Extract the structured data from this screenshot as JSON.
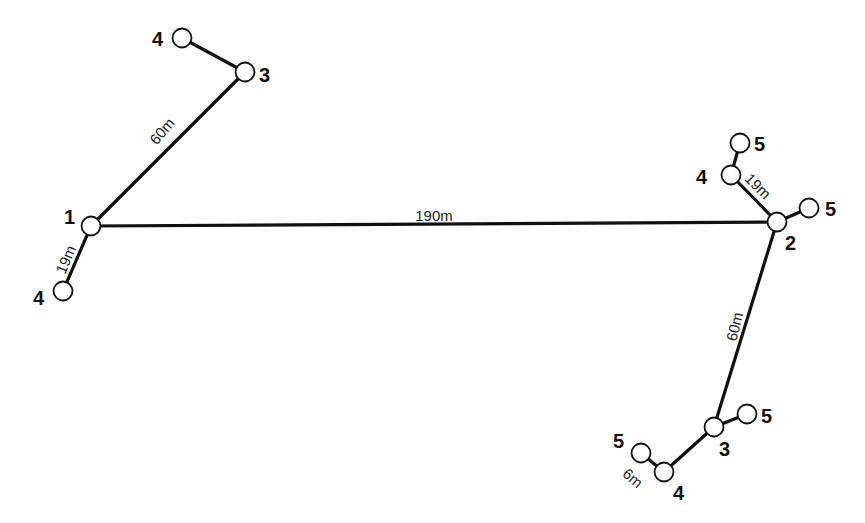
{
  "diagram": {
    "type": "tree-network",
    "nodes": [
      {
        "id": "n1",
        "label": "1",
        "x": 91,
        "y": 226,
        "lx": 64,
        "ly": 224
      },
      {
        "id": "n4a",
        "label": "4",
        "x": 63,
        "y": 291,
        "lx": 33,
        "ly": 305
      },
      {
        "id": "n3a",
        "label": "3",
        "x": 245,
        "y": 72,
        "lx": 259,
        "ly": 82
      },
      {
        "id": "n4b",
        "label": "4",
        "x": 182,
        "y": 38,
        "lx": 152,
        "ly": 46
      },
      {
        "id": "n2",
        "label": "2",
        "x": 777,
        "y": 222,
        "lx": 785,
        "ly": 250
      },
      {
        "id": "n4c",
        "label": "4",
        "x": 731,
        "y": 175,
        "lx": 696,
        "ly": 184
      },
      {
        "id": "n5a",
        "label": "5",
        "x": 740,
        "y": 143,
        "lx": 754,
        "ly": 151
      },
      {
        "id": "n5b",
        "label": "5",
        "x": 809,
        "y": 208,
        "lx": 825,
        "ly": 216
      },
      {
        "id": "n3b",
        "label": "3",
        "x": 714,
        "y": 427,
        "lx": 719,
        "ly": 456
      },
      {
        "id": "n5c",
        "label": "5",
        "x": 747,
        "y": 414,
        "lx": 761,
        "ly": 423
      },
      {
        "id": "n4d",
        "label": "4",
        "x": 664,
        "y": 472,
        "lx": 673,
        "ly": 500
      },
      {
        "id": "n5d",
        "label": "5",
        "x": 641,
        "y": 453,
        "lx": 613,
        "ly": 448
      }
    ],
    "edges": [
      {
        "from": "n1",
        "to": "n2",
        "label": "190m",
        "lx": 434,
        "ly": 217,
        "rot": 0
      },
      {
        "from": "n1",
        "to": "n3a",
        "label": "60m",
        "lx": 163,
        "ly": 132,
        "rot": -50
      },
      {
        "from": "n1",
        "to": "n4a",
        "label": "19m",
        "lx": 67,
        "ly": 260,
        "rot": -67
      },
      {
        "from": "n3a",
        "to": "n4b",
        "label": "",
        "lx": 0,
        "ly": 0,
        "rot": 0
      },
      {
        "from": "n2",
        "to": "n4c",
        "label": "19m",
        "lx": 757,
        "ly": 187,
        "rot": 45
      },
      {
        "from": "n4c",
        "to": "n5a",
        "label": "",
        "lx": 0,
        "ly": 0,
        "rot": 0
      },
      {
        "from": "n2",
        "to": "n5b",
        "label": "",
        "lx": 0,
        "ly": 0,
        "rot": 0
      },
      {
        "from": "n2",
        "to": "n3b",
        "label": "60m",
        "lx": 736,
        "ly": 327,
        "rot": -76
      },
      {
        "from": "n3b",
        "to": "n5c",
        "label": "",
        "lx": 0,
        "ly": 0,
        "rot": 0
      },
      {
        "from": "n3b",
        "to": "n4d",
        "label": "",
        "lx": 0,
        "ly": 0,
        "rot": 0
      },
      {
        "from": "n4d",
        "to": "n5d",
        "label": "6m",
        "lx": 632,
        "ly": 479,
        "rot": 40
      }
    ],
    "node_radius": 9.5,
    "colors": {
      "line": "#111111",
      "node_fill": "#ffffff",
      "background": "#ffffff"
    }
  }
}
